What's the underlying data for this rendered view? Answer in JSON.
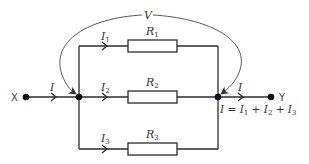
{
  "diagram": {
    "terminals": {
      "left": "X",
      "right": "Y"
    },
    "voltage_label": "V",
    "current_main": {
      "symbol": "I"
    },
    "branches": [
      {
        "current": "I",
        "current_sub": "1",
        "resistor": "R",
        "resistor_sub": "1"
      },
      {
        "current": "I",
        "current_sub": "2",
        "resistor": "R",
        "resistor_sub": "2"
      },
      {
        "current": "I",
        "current_sub": "3",
        "resistor": "R",
        "resistor_sub": "3"
      }
    ],
    "equation": {
      "lhs": "I",
      "eq": " = ",
      "t1": "I",
      "t1_sub": "1",
      "plus1": " + ",
      "t2": "I",
      "t2_sub": "2",
      "plus2": " + ",
      "t3": "I",
      "t3_sub": "3"
    },
    "colors": {
      "wire": "#2a2a2a",
      "background": "#ffffff",
      "node": "#111111"
    }
  }
}
